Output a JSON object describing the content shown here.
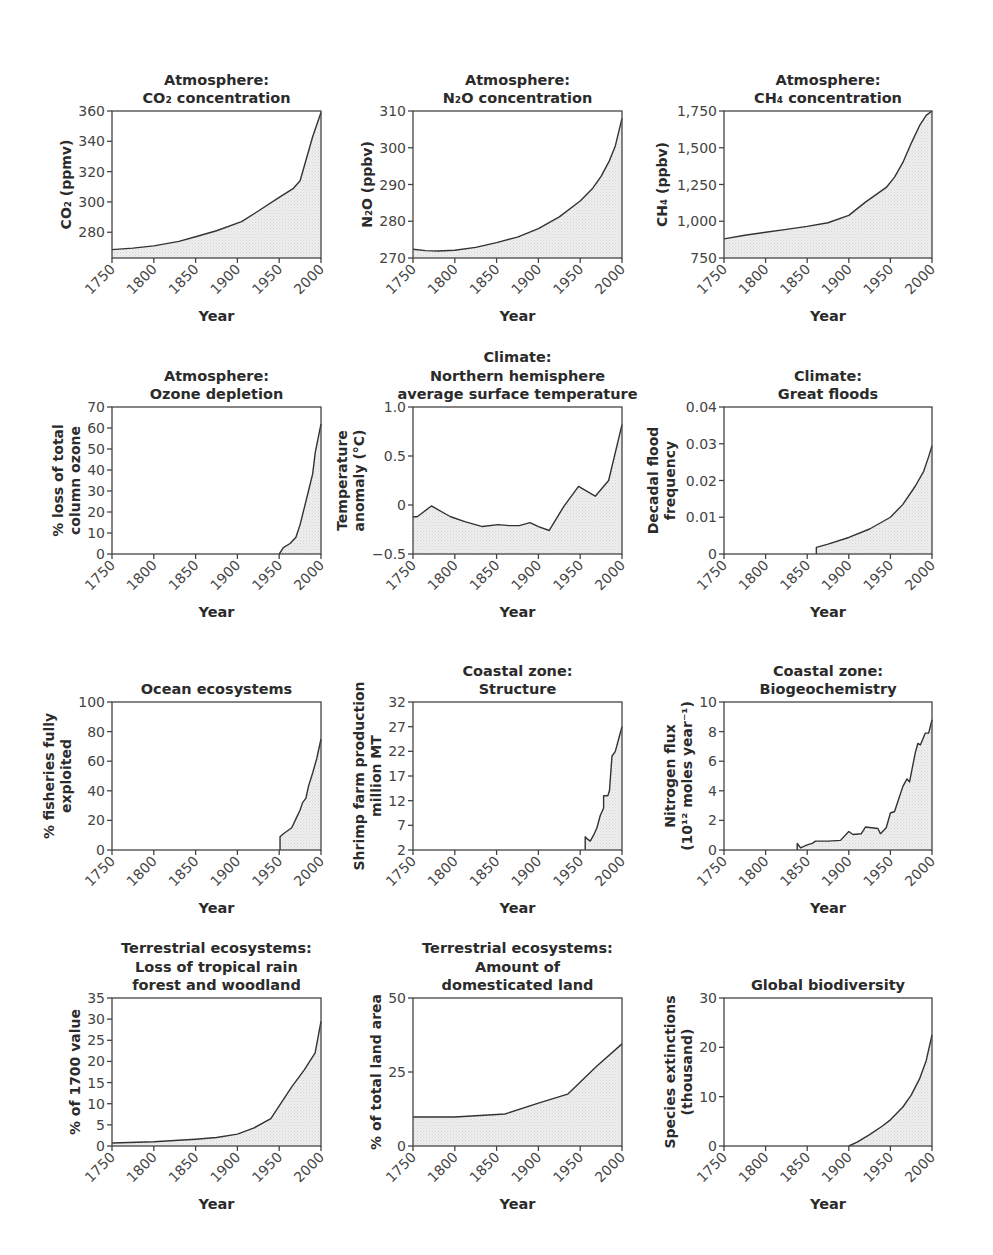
{
  "chart_data": [
    {
      "id": "co2",
      "type": "area",
      "title": [
        "Atmosphere:",
        "CO₂ concentration"
      ],
      "xlabel": "Year",
      "ylabel": [
        "CO₂ (ppmv)"
      ],
      "xlim": [
        1750,
        2000
      ],
      "ylim": [
        263,
        360
      ],
      "xticks": [
        1750,
        1800,
        1850,
        1900,
        1950,
        2000
      ],
      "yticks": [
        280,
        300,
        320,
        340,
        360
      ],
      "yticklabels": [
        "280",
        "300",
        "320",
        "340",
        "360"
      ],
      "x": [
        1750,
        1775,
        1800,
        1830,
        1850,
        1875,
        1905,
        1925,
        1950,
        1967,
        1975,
        1990,
        2000
      ],
      "y": [
        268.5,
        269.5,
        271,
        274,
        277,
        281,
        287,
        294,
        303,
        309,
        314,
        343,
        359
      ]
    },
    {
      "id": "n2o",
      "type": "area",
      "title": [
        "Atmosphere:",
        "N₂O concentration"
      ],
      "xlabel": "Year",
      "ylabel": [
        "N₂O (ppbv)"
      ],
      "xlim": [
        1750,
        2000
      ],
      "ylim": [
        270,
        310
      ],
      "xticks": [
        1750,
        1800,
        1850,
        1900,
        1950,
        2000
      ],
      "yticks": [
        270,
        280,
        290,
        300,
        310
      ],
      "yticklabels": [
        "270",
        "280",
        "290",
        "300",
        "310"
      ],
      "x": [
        1750,
        1765,
        1780,
        1800,
        1825,
        1850,
        1875,
        1900,
        1925,
        1950,
        1965,
        1975,
        1985,
        1992,
        2000
      ],
      "y": [
        272.4,
        272.0,
        271.9,
        272.1,
        272.9,
        274.2,
        275.7,
        278.0,
        281.2,
        285.5,
        289.0,
        292.2,
        296.5,
        300.5,
        308
      ]
    },
    {
      "id": "ch4",
      "type": "area",
      "title": [
        "Atmosphere:",
        "CH₄ concentration"
      ],
      "xlabel": "Year",
      "ylabel": [
        "CH₄ (ppbv)"
      ],
      "xlim": [
        1750,
        2000
      ],
      "ylim": [
        750,
        1750
      ],
      "xticks": [
        1750,
        1800,
        1850,
        1900,
        1950,
        2000
      ],
      "yticks": [
        750,
        1000,
        1250,
        1500,
        1750
      ],
      "yticklabels": [
        "750",
        "1,000",
        "1,250",
        "1,500",
        "1,750"
      ],
      "x": [
        1750,
        1775,
        1800,
        1825,
        1850,
        1875,
        1900,
        1920,
        1945,
        1955,
        1965,
        1975,
        1985,
        1993,
        2000
      ],
      "y": [
        880,
        905,
        925,
        945,
        965,
        990,
        1040,
        1130,
        1230,
        1300,
        1400,
        1530,
        1650,
        1720,
        1750
      ]
    },
    {
      "id": "ozone",
      "type": "area",
      "title": [
        "Atmosphere:",
        "Ozone depletion"
      ],
      "xlabel": "Year",
      "ylabel": [
        "% loss of total",
        "column ozone"
      ],
      "xlim": [
        1750,
        2000
      ],
      "ylim": [
        0,
        70
      ],
      "xticks": [
        1750,
        1800,
        1850,
        1900,
        1950,
        2000
      ],
      "yticks": [
        0,
        10,
        20,
        30,
        40,
        50,
        60,
        70
      ],
      "yticklabels": [
        "0",
        "10",
        "20",
        "30",
        "40",
        "50",
        "60",
        "70"
      ],
      "x": [
        1950,
        1955,
        1963,
        1970,
        1975,
        1980,
        1985,
        1990,
        1993,
        1997,
        2000
      ],
      "y": [
        0,
        3,
        5,
        8,
        14,
        22,
        30,
        38,
        48,
        56,
        62
      ]
    },
    {
      "id": "temperature",
      "type": "area",
      "title": [
        "Climate:",
        "Northern hemisphere",
        "average surface temperature"
      ],
      "xlabel": "Year",
      "ylabel": [
        "Temperature",
        "anomaly (°C)"
      ],
      "xlim": [
        1750,
        2000
      ],
      "ylim": [
        -0.5,
        1.0
      ],
      "xticks": [
        1750,
        1800,
        1850,
        1900,
        1950,
        2000
      ],
      "yticks": [
        -0.5,
        0,
        0.5,
        1.0
      ],
      "yticklabels": [
        "−0.5",
        "0",
        "0.5",
        "1.0"
      ],
      "x": [
        1750,
        1755,
        1772,
        1795,
        1812,
        1833,
        1852,
        1865,
        1877,
        1890,
        1900,
        1913,
        1930,
        1948,
        1968,
        1984,
        2000
      ],
      "y": [
        -0.12,
        -0.12,
        -0.01,
        -0.12,
        -0.17,
        -0.22,
        -0.2,
        -0.21,
        -0.21,
        -0.18,
        -0.22,
        -0.26,
        -0.02,
        0.19,
        0.09,
        0.25,
        0.82
      ]
    },
    {
      "id": "floods",
      "type": "area",
      "title": [
        "Climate:",
        "Great floods"
      ],
      "xlabel": "Year",
      "ylabel": [
        "Decadal flood",
        "frequency"
      ],
      "xlim": [
        1750,
        2000
      ],
      "ylim": [
        0,
        0.04
      ],
      "xticks": [
        1750,
        1800,
        1850,
        1900,
        1950,
        2000
      ],
      "yticks": [
        0,
        0.01,
        0.02,
        0.03,
        0.04
      ],
      "yticklabels": [
        "0",
        "0.01",
        "0.02",
        "0.03",
        "0.04"
      ],
      "x": [
        1861,
        1861,
        1875,
        1900,
        1925,
        1950,
        1965,
        1980,
        1990,
        1996,
        2000
      ],
      "y": [
        0,
        0.0018,
        0.0027,
        0.0045,
        0.0068,
        0.01,
        0.0135,
        0.0185,
        0.0225,
        0.0265,
        0.0295
      ]
    },
    {
      "id": "fisheries",
      "type": "area",
      "title": [
        "",
        "Ocean ecosystems"
      ],
      "xlabel": "Year",
      "ylabel": [
        "% fisheries fully",
        "exploited"
      ],
      "xlim": [
        1750,
        2000
      ],
      "ylim": [
        0,
        100
      ],
      "xticks": [
        1750,
        1800,
        1850,
        1900,
        1950,
        2000
      ],
      "yticks": [
        0,
        20,
        40,
        60,
        80,
        100
      ],
      "yticklabels": [
        "0",
        "20",
        "40",
        "60",
        "80",
        "100"
      ],
      "x": [
        1951,
        1951,
        1955,
        1960,
        1965,
        1970,
        1975,
        1978,
        1982,
        1985,
        1990,
        1995,
        2000
      ],
      "y": [
        0,
        9,
        11,
        13,
        15,
        21,
        27,
        32,
        35,
        43,
        52,
        62,
        75
      ]
    },
    {
      "id": "shrimp",
      "type": "area",
      "title": [
        "Coastal zone:",
        "Structure"
      ],
      "xlabel": "Year",
      "ylabel": [
        "Shrimp farm production",
        "million MT"
      ],
      "xlim": [
        1750,
        2000
      ],
      "ylim": [
        2,
        32
      ],
      "xticks": [
        1750,
        1800,
        1850,
        1900,
        1950,
        2000
      ],
      "yticks": [
        2,
        7,
        12,
        17,
        22,
        27,
        32
      ],
      "yticklabels": [
        "2",
        "7",
        "12",
        "17",
        "22",
        "27",
        "32"
      ],
      "x": [
        1956,
        1956,
        1958,
        1962,
        1966,
        1970,
        1974,
        1978,
        1978,
        1983,
        1985,
        1988,
        1992,
        1996,
        2000
      ],
      "y": [
        2,
        4.7,
        4.3,
        3.8,
        5,
        6.5,
        9,
        10.5,
        13,
        13,
        14,
        21,
        22,
        24.5,
        27
      ]
    },
    {
      "id": "nitrogen",
      "type": "area",
      "title": [
        "Coastal zone:",
        "Biogeochemistry"
      ],
      "xlabel": "Year",
      "ylabel": [
        "Nitrogen flux",
        "(10¹² moles year⁻¹)"
      ],
      "xlim": [
        1750,
        2000
      ],
      "ylim": [
        0,
        10
      ],
      "xticks": [
        1750,
        1800,
        1850,
        1900,
        1950,
        2000
      ],
      "yticks": [
        0,
        2,
        4,
        6,
        8,
        10
      ],
      "yticklabels": [
        "0",
        "2",
        "4",
        "6",
        "8",
        "10"
      ],
      "x": [
        1838,
        1838,
        1842,
        1850,
        1856,
        1860,
        1875,
        1890,
        1900,
        1905,
        1915,
        1920,
        1935,
        1938,
        1945,
        1950,
        1955,
        1965,
        1970,
        1973,
        1980,
        1983,
        1986,
        1992,
        1996,
        2000
      ],
      "y": [
        0,
        0.45,
        0.15,
        0.35,
        0.45,
        0.6,
        0.6,
        0.65,
        1.25,
        1.05,
        1.1,
        1.55,
        1.45,
        1.1,
        1.5,
        2.5,
        2.6,
        4.3,
        4.8,
        4.6,
        6.6,
        7.2,
        7.1,
        7.9,
        7.9,
        8.8
      ]
    },
    {
      "id": "rainforest",
      "type": "area",
      "title": [
        "Terrestrial ecosystems:",
        "Loss of tropical rain",
        "forest and woodland"
      ],
      "xlabel": "Year",
      "ylabel": [
        "% of 1700 value"
      ],
      "xlim": [
        1750,
        2000
      ],
      "ylim": [
        0,
        35
      ],
      "xticks": [
        1750,
        1800,
        1850,
        1900,
        1950,
        2000
      ],
      "yticks": [
        0,
        5,
        10,
        15,
        20,
        25,
        30,
        35
      ],
      "yticklabels": [
        "0",
        "5",
        "10",
        "15",
        "20",
        "25",
        "30",
        "35"
      ],
      "x": [
        1750,
        1800,
        1850,
        1875,
        1900,
        1920,
        1940,
        1950,
        1965,
        1980,
        1993,
        2000
      ],
      "y": [
        0.7,
        1.0,
        1.6,
        2.0,
        2.8,
        4.3,
        6.5,
        9.5,
        14,
        18,
        22,
        29.5
      ]
    },
    {
      "id": "domesticated",
      "type": "area",
      "title": [
        "Terrestrial ecosystems:",
        "Amount of",
        "domesticated land"
      ],
      "xlabel": "Year",
      "ylabel": [
        "% of total land area"
      ],
      "xlim": [
        1750,
        2000
      ],
      "ylim": [
        0,
        50
      ],
      "xticks": [
        1750,
        1800,
        1850,
        1900,
        1950,
        2000
      ],
      "yticks": [
        0,
        25,
        50
      ],
      "yticklabels": [
        "0",
        "25",
        "50"
      ],
      "x": [
        1750,
        1800,
        1860,
        1900,
        1935,
        1970,
        2000
      ],
      "y": [
        9.8,
        9.8,
        10.8,
        14.5,
        17.5,
        27,
        34.5
      ]
    },
    {
      "id": "biodiversity",
      "type": "area",
      "title": [
        "",
        "Global biodiversity"
      ],
      "xlabel": "Year",
      "ylabel": [
        "Species extinctions",
        "(thousand)"
      ],
      "xlim": [
        1750,
        2000
      ],
      "ylim": [
        0,
        30
      ],
      "xticks": [
        1750,
        1800,
        1850,
        1900,
        1950,
        2000
      ],
      "yticks": [
        0,
        10,
        20,
        30
      ],
      "yticklabels": [
        "0",
        "10",
        "20",
        "30"
      ],
      "x": [
        1900,
        1910,
        1925,
        1940,
        1950,
        1965,
        1975,
        1985,
        1993,
        2000
      ],
      "y": [
        0,
        0.8,
        2.3,
        4.0,
        5.3,
        7.9,
        10.3,
        13.6,
        17.3,
        22.5
      ]
    }
  ]
}
